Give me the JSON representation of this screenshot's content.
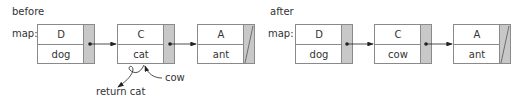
{
  "before": {
    "title": "before",
    "map_label": "map:",
    "nodes": [
      {
        "key": "D",
        "value": "dog",
        "next": "pointer"
      },
      {
        "key": "C",
        "value": "cat",
        "next": "pointer"
      },
      {
        "key": "A",
        "value": "ant",
        "next": "null"
      }
    ],
    "annotations": {
      "new_value": "cow",
      "returned": "return cat"
    }
  },
  "after": {
    "title": "after",
    "map_label": "map:",
    "nodes": [
      {
        "key": "D",
        "value": "dog",
        "next": "pointer"
      },
      {
        "key": "C",
        "value": "cow",
        "next": "pointer"
      },
      {
        "key": "A",
        "value": "ant",
        "next": "null"
      }
    ]
  },
  "colors": {
    "border": "#8a8a8a",
    "pointer_fill": "#c8c8c8",
    "text": "#333333",
    "arrow": "#222222"
  }
}
